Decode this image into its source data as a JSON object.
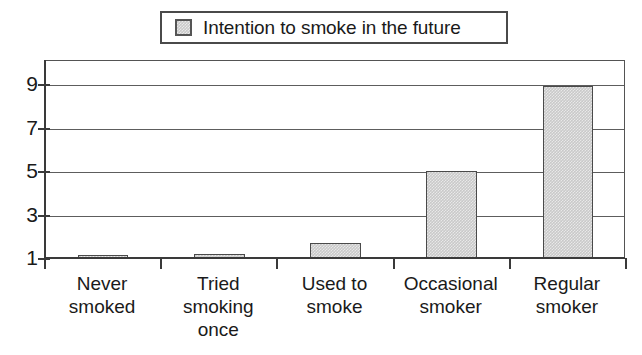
{
  "chart_data": {
    "type": "bar",
    "title": "",
    "subtitle": "",
    "xlabel": "",
    "ylabel": "",
    "categories": [
      "Never smoked",
      "Tried smoking once",
      "Used to smoke",
      "Occasional smoker",
      "Regular smoker"
    ],
    "category_lines": [
      [
        "Never",
        "smoked"
      ],
      [
        "Tried",
        "smoking",
        "once"
      ],
      [
        "Used to",
        "smoke"
      ],
      [
        "Occasional",
        "smoker"
      ],
      [
        "Regular",
        "smoker"
      ]
    ],
    "series": [
      {
        "name": "Intention to smoke in the future",
        "values": [
          1.05,
          1.2,
          1.7,
          5.0,
          8.9
        ]
      }
    ],
    "values": [
      1.05,
      1.2,
      1.7,
      5.0,
      8.9
    ],
    "ylim": [
      1,
      10
    ],
    "yticks": [
      1,
      3,
      5,
      7,
      9
    ],
    "ytick_labels": [
      "1",
      "3",
      "5",
      "7",
      "9"
    ],
    "grid": "horizontal",
    "legend_position": "top-center",
    "legend_entries": [
      "Intention to smoke in the future"
    ],
    "colors": {
      "bar_fill": "#c9c9c9",
      "bar_border": "#4a4a4a",
      "axis": "#3a3a3a",
      "gridline": "#5d5d5d",
      "text": "#1a1a1a",
      "background": "#ffffff"
    }
  },
  "legend": {
    "label": "Intention to smoke in the future",
    "swatch_name": "legend-color-swatch"
  }
}
